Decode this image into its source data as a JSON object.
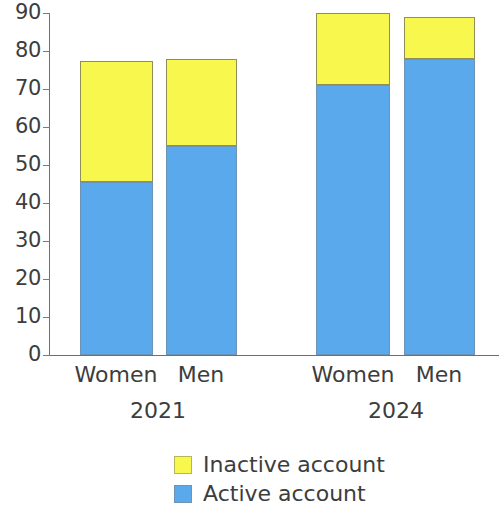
{
  "chart_data": {
    "type": "bar",
    "title": "",
    "subtitle": "",
    "xlabel": "",
    "ylabel": "",
    "stacked": true,
    "grid": false,
    "legend_position": "bottom",
    "ylim": [
      0,
      90
    ],
    "yticks": [
      0,
      10,
      20,
      30,
      40,
      50,
      60,
      70,
      80,
      90
    ],
    "ytick_labels": [
      "0",
      "10",
      "20",
      "30",
      "40",
      "50",
      "60",
      "70",
      "80",
      "90"
    ],
    "groups": [
      {
        "label": "2021",
        "categories": [
          "Women",
          "Men"
        ]
      },
      {
        "label": "2024",
        "categories": [
          "Women",
          "Men"
        ]
      }
    ],
    "categories": [
      "Women",
      "Men",
      "Women",
      "Men"
    ],
    "group_of_category": [
      "2021",
      "2021",
      "2024",
      "2024"
    ],
    "series": [
      {
        "name": "Active account",
        "color": "#5aa9ec",
        "values": [
          45.5,
          55,
          71,
          78
        ]
      },
      {
        "name": "Inactive account",
        "color": "#f7f74e",
        "values": [
          32,
          23,
          19,
          11
        ]
      }
    ],
    "totals": [
      77.5,
      78,
      90,
      89
    ],
    "legend": [
      {
        "label": "Inactive account",
        "color": "#f7f74e"
      },
      {
        "label": "Active account",
        "color": "#5aa9ec"
      }
    ],
    "colors": {
      "inactive": "#f7f74e",
      "active": "#5aa9ec",
      "axis": "#6f6f6f",
      "text": "#3d3d3d",
      "background": "#ffffff"
    }
  },
  "bars": [
    {
      "name": "women-2021",
      "category": "Women",
      "group": "2021",
      "active": 45.5,
      "inactive": 32,
      "total": 77.5,
      "x": 80,
      "width": 73
    },
    {
      "name": "men-2021",
      "category": "Men",
      "group": "2021",
      "active": 55,
      "inactive": 23,
      "total": 78,
      "x": 166,
      "width": 71
    },
    {
      "name": "women-2024",
      "category": "Women",
      "group": "2024",
      "active": 71,
      "inactive": 19,
      "total": 90,
      "x": 316,
      "width": 74
    },
    {
      "name": "men-2024",
      "category": "Men",
      "group": "2024",
      "active": 78,
      "inactive": 11,
      "total": 89,
      "x": 404,
      "width": 71
    }
  ],
  "axis": {
    "y_labels": [
      "90",
      "80",
      "70",
      "60",
      "50",
      "40",
      "30",
      "20",
      "10",
      "0"
    ]
  },
  "x_labels": [
    {
      "text": "Women",
      "center": 116
    },
    {
      "text": "Men",
      "center": 201
    },
    {
      "text": "Women",
      "center": 353
    },
    {
      "text": "Men",
      "center": 439
    }
  ],
  "group_labels": [
    {
      "text": "2021",
      "center": 158
    },
    {
      "text": "2024",
      "center": 396
    }
  ]
}
